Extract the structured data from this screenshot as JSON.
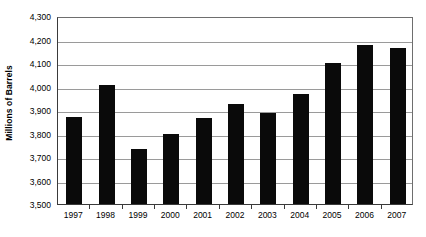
{
  "chart_data": {
    "type": "bar",
    "title": "",
    "xlabel": "",
    "ylabel": "Millions of Barrels",
    "categories": [
      "1997",
      "1998",
      "1999",
      "2000",
      "2001",
      "2002",
      "2003",
      "2004",
      "2005",
      "2006",
      "2007"
    ],
    "values": [
      3870,
      4005,
      3735,
      3800,
      3868,
      3925,
      3888,
      3968,
      4098,
      4175,
      4162
    ],
    "ylim": [
      3500,
      4300
    ],
    "ytick_values": [
      3500,
      3600,
      3700,
      3800,
      3900,
      4000,
      4100,
      4200,
      4300
    ],
    "ytick_labels": [
      "3,500",
      "3,600",
      "3,700",
      "3,800",
      "3,900",
      "4,000",
      "4,100",
      "4,200",
      "4,300"
    ],
    "grid": true,
    "legend": null,
    "bar_color": "#0a0a0a",
    "gridline_color": "#9a9a9a",
    "axis_color": "#3a3a3a",
    "background_color": "#ffffff"
  }
}
